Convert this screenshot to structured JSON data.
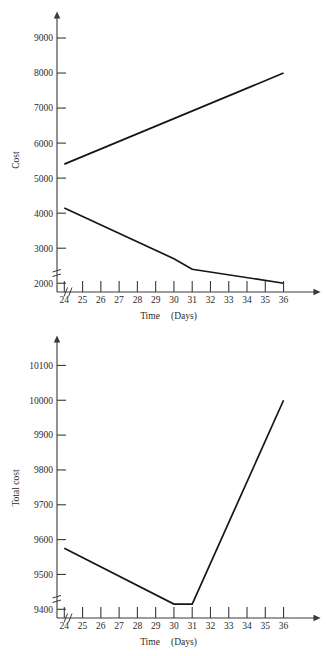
{
  "figure": {
    "title": "",
    "background": "#ffffff",
    "line_color": "#161616",
    "axis_color": "#3a3a3a"
  },
  "chart_data": [
    {
      "id": "top",
      "type": "line",
      "title": "",
      "xlabel": "Time",
      "xlabel_unit": "(Days)",
      "ylabel": "Cost",
      "x": [
        24,
        25,
        26,
        27,
        28,
        29,
        30,
        31,
        32,
        33,
        34,
        35,
        36
      ],
      "xticklabels": [
        "24",
        "25",
        "26",
        "27",
        "28",
        "29",
        "30",
        "31",
        "32",
        "33",
        "34",
        "35",
        "36"
      ],
      "yticks": [
        2000,
        3000,
        4000,
        5000,
        6000,
        7000,
        8000,
        9000
      ],
      "yticklabels": [
        "2000",
        "3000",
        "4000",
        "5000",
        "6000",
        "7000",
        "8000",
        "9000"
      ],
      "ylim": [
        1750,
        9400
      ],
      "xlim": [
        23.6,
        36.9
      ],
      "grid": false,
      "legend": false,
      "axis_break_x": true,
      "axis_break_y": true,
      "series": [
        {
          "name": "Direct cost",
          "x": [
            24,
            36
          ],
          "values": [
            5400,
            8000
          ]
        },
        {
          "name": "Indirect cost",
          "x": [
            24,
            30,
            31,
            36
          ],
          "values": [
            4150,
            2700,
            2400,
            2000
          ]
        }
      ]
    },
    {
      "id": "bottom",
      "type": "line",
      "title": "",
      "xlabel": "Time",
      "xlabel_unit": "(Days)",
      "ylabel": "Total cost",
      "x": [
        24,
        25,
        26,
        27,
        28,
        29,
        30,
        31,
        32,
        33,
        34,
        35,
        36
      ],
      "xticklabels": [
        "24",
        "25",
        "26",
        "27",
        "28",
        "29",
        "30",
        "31",
        "32",
        "33",
        "34",
        "35",
        "36"
      ],
      "yticks": [
        9400,
        9500,
        9600,
        9700,
        9800,
        9900,
        10000,
        10100
      ],
      "yticklabels": [
        "9400",
        "9500",
        "9600",
        "9700",
        "9800",
        "9900",
        "10000",
        "10100"
      ],
      "ylim": [
        9375,
        10150
      ],
      "xlim": [
        23.6,
        36.9
      ],
      "grid": false,
      "legend": false,
      "axis_break_x": true,
      "axis_break_y": true,
      "series": [
        {
          "name": "Total cost",
          "x": [
            24,
            30,
            31,
            36
          ],
          "values": [
            9575,
            9415,
            9415,
            10000
          ]
        }
      ]
    }
  ]
}
